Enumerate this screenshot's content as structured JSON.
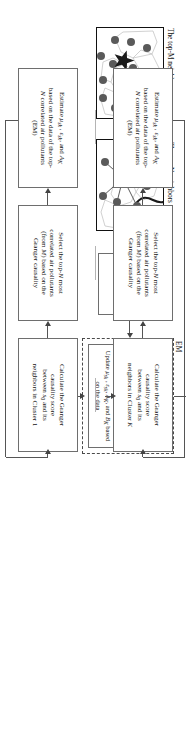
{
  "figure": {
    "em_label": "EM",
    "captions": {
      "top_m": "The top-M neighbors",
      "top_n": "The top-N neighbors"
    }
  },
  "boxes": {
    "initiate": "Initiate K by\nclustering E_t",
    "em_expectation_step": "Estimate P(K|Q_t, E_t, P_t) based on μ_sk, ε_sk, A_K, B_K",
    "em_expectation_label": "Expectation",
    "em_maximization_label": "Maximization",
    "em_maximization_step": "Update μ_sk , ε_sk, A_K, and B_K based on the data"
  },
  "rows": [
    {
      "id": "row-1",
      "granger": "Calculate the Granger\ncausality score\nbetween s₀ and its\nneighbors in Cluster 1",
      "select": "Select the top-N most\ncorrelated air pollutants\n(from M) based on the\nGranger causality",
      "estimate": "Estimate μ_sk , ε_sk, and A_K\nbased on the data of the top-\nN correlated air pollutants\n(EM)"
    },
    {
      "id": "row-k",
      "granger": "Calculate the Granger\ncausality score\nbetween s₀ and its\nneighbors in Cluster K",
      "select": "Select the top-N most\ncorrelated air pollutants\n(from M) based on the\nGranger causality",
      "estimate": "Estimate μ_sk , ε_sk, and A_K\nbased on the data of the top-\nN correlated air pollutants\n(EM)"
    }
  ],
  "colors": {
    "box_border": "#6e6e6e",
    "connector": "#555555",
    "map_border": "#111111",
    "map_node": "#5a5a5a",
    "ellipsis": "#b4b4b4"
  }
}
